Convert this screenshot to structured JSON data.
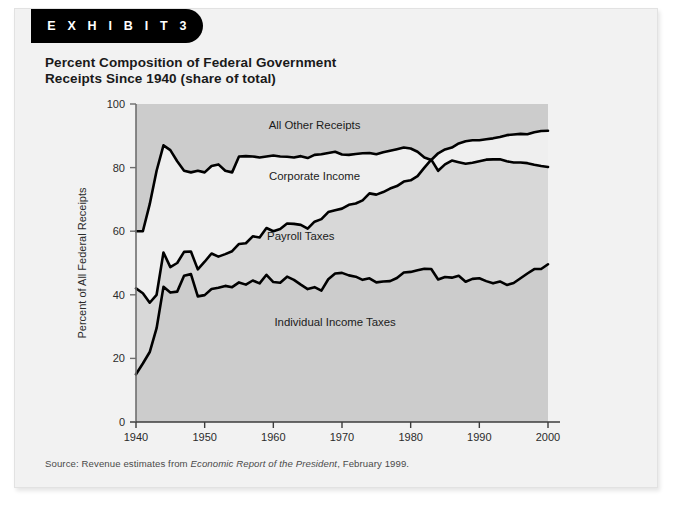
{
  "exhibit": {
    "tab_label": "E X H I B I T   3",
    "title": "Percent Composition of Federal Government\nReceipts Since 1940 (share of total)",
    "source_prefix": "Source: Revenue estimates from ",
    "source_italic": "Economic Report of the President",
    "source_suffix": ", February 1999."
  },
  "colors": {
    "card_bg": "#f2f2f2",
    "tab_bg": "#000000",
    "plot_bg": "#cccccc",
    "band_light": "#efefef",
    "line": "#000000",
    "axis": "#6e6e6e",
    "text": "#1a1a1a"
  },
  "chart_data": {
    "type": "area",
    "title": "Percent Composition of Federal Government Receipts Since 1940 (share of total)",
    "xlabel": "",
    "ylabel": "Percent of All Federal Receipts",
    "xlim": [
      1940,
      2000
    ],
    "ylim": [
      0,
      100
    ],
    "xticks": [
      1940,
      1950,
      1960,
      1970,
      1980,
      1990,
      2000
    ],
    "yticks": [
      0,
      20,
      40,
      60,
      80,
      100
    ],
    "grid": false,
    "legend_position": "inline-annotations",
    "stacked": true,
    "annotations": [
      {
        "text": "All Other Receipts",
        "x": 1966,
        "y": 93.5
      },
      {
        "text": "Corporate Income",
        "x": 1966,
        "y": 77.5
      },
      {
        "text": "Payroll Taxes",
        "x": 1964,
        "y": 58.5
      },
      {
        "text": "Individual Income Taxes",
        "x": 1969,
        "y": 31.5
      }
    ],
    "x": [
      1940,
      1941,
      1942,
      1943,
      1944,
      1945,
      1946,
      1947,
      1948,
      1949,
      1950,
      1951,
      1952,
      1953,
      1954,
      1955,
      1956,
      1957,
      1958,
      1959,
      1960,
      1961,
      1962,
      1963,
      1964,
      1965,
      1966,
      1967,
      1968,
      1969,
      1970,
      1971,
      1972,
      1973,
      1974,
      1975,
      1976,
      1977,
      1978,
      1979,
      1980,
      1981,
      1982,
      1983,
      1984,
      1985,
      1986,
      1987,
      1988,
      1989,
      1990,
      1991,
      1992,
      1993,
      1994,
      1995,
      1996,
      1997,
      1998,
      1999,
      2000
    ],
    "boundaries": [
      {
        "name": "Individual Income Taxes (top of band 1)",
        "values": [
          15.0,
          18.4,
          22.0,
          29.5,
          42.5,
          40.7,
          41.0,
          46.0,
          46.5,
          39.5,
          39.9,
          41.8,
          42.2,
          42.8,
          42.4,
          43.9,
          43.2,
          44.5,
          43.6,
          46.3,
          44.0,
          43.8,
          45.7,
          44.7,
          43.2,
          41.8,
          42.4,
          41.3,
          44.9,
          46.7,
          46.9,
          46.1,
          45.7,
          44.7,
          45.2,
          43.9,
          44.2,
          44.3,
          45.3,
          47.0,
          47.2,
          47.7,
          48.2,
          48.1,
          44.8,
          45.6,
          45.4,
          46.0,
          44.1,
          45.0,
          45.2,
          44.3,
          43.6,
          44.2,
          43.1,
          43.7,
          45.2,
          46.7,
          48.1,
          48.1,
          49.6
        ]
      },
      {
        "name": "Payroll Taxes (top of band 2)",
        "values": [
          42.0,
          40.5,
          37.5,
          40.0,
          53.3,
          48.7,
          50.0,
          53.5,
          53.6,
          48.0,
          50.4,
          53.0,
          52.0,
          52.8,
          53.7,
          56.0,
          56.2,
          58.4,
          58.0,
          61.0,
          60.0,
          60.7,
          62.4,
          62.3,
          62.0,
          60.8,
          63.0,
          63.8,
          66.0,
          66.6,
          67.1,
          68.3,
          68.7,
          69.7,
          71.9,
          71.5,
          72.3,
          73.4,
          74.2,
          75.6,
          76.0,
          77.3,
          80.0,
          82.5,
          79.0,
          81.0,
          82.2,
          81.7,
          81.2,
          81.5,
          82.0,
          82.5,
          82.6,
          82.6,
          82.0,
          81.6,
          81.6,
          81.4,
          80.9,
          80.5,
          80.2
        ]
      },
      {
        "name": "Corporate Income (top of band 3)",
        "values": [
          60.0,
          60.0,
          68.5,
          79.0,
          87.0,
          85.5,
          82.0,
          79.0,
          78.5,
          79.0,
          78.5,
          80.5,
          81.0,
          79.0,
          78.5,
          83.5,
          83.6,
          83.5,
          83.2,
          83.5,
          83.8,
          83.5,
          83.4,
          83.2,
          83.6,
          83.0,
          84.0,
          84.2,
          84.6,
          85.0,
          84.1,
          84.0,
          84.3,
          84.5,
          84.6,
          84.2,
          84.8,
          85.3,
          85.8,
          86.3,
          86.0,
          85.0,
          83.2,
          82.4,
          84.5,
          85.7,
          86.3,
          87.6,
          88.3,
          88.6,
          88.6,
          88.9,
          89.2,
          89.6,
          90.2,
          90.4,
          90.6,
          90.5,
          91.1,
          91.5,
          91.6
        ]
      }
    ],
    "bands": [
      {
        "name": "Individual Income Taxes",
        "fill": "#cccccc",
        "from": 0
      },
      {
        "name": "Payroll Taxes",
        "fill": "#d8d8d8"
      },
      {
        "name": "Corporate Income",
        "fill": "#efefef"
      },
      {
        "name": "All Other Receipts",
        "fill": "#cccccc",
        "to": 100
      }
    ]
  }
}
